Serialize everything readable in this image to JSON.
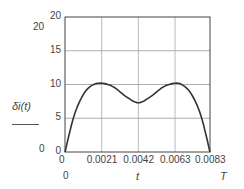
{
  "chart_data": {
    "type": "line",
    "title": "",
    "xlabel": "t",
    "ylabel": "δi(t)",
    "x_ticks": [
      "0",
      "0.0021",
      "0.0042",
      "0.0063",
      "0.0083"
    ],
    "y_ticks": [
      "0",
      "5",
      "10",
      "15",
      "20"
    ],
    "xlim": [
      0,
      0.0083
    ],
    "ylim": [
      0,
      20
    ],
    "grid": true,
    "extra_labels": {
      "y_axis_top": "20",
      "y_axis_bottom": "0",
      "x_axis_left": "0",
      "x_axis_right": "T"
    },
    "series": [
      {
        "name": "δi(t)",
        "x": [
          0,
          0.0005,
          0.001,
          0.0015,
          0.0021,
          0.0028,
          0.0035,
          0.0042,
          0.0049,
          0.0056,
          0.0063,
          0.0068,
          0.0073,
          0.0078,
          0.0083
        ],
        "y": [
          0,
          5.2,
          8.3,
          9.8,
          10.2,
          9.6,
          8.2,
          7.3,
          8.2,
          9.6,
          10.2,
          9.8,
          8.3,
          5.2,
          0
        ]
      }
    ]
  }
}
